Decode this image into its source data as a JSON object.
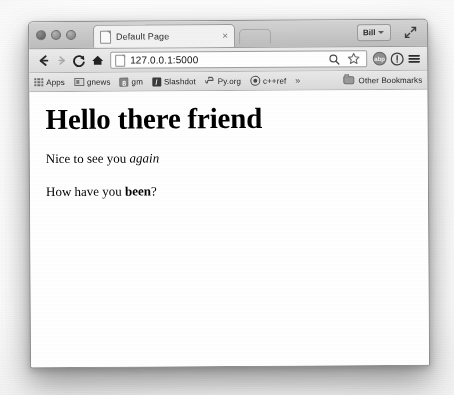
{
  "window": {
    "traffic_lights": [
      "close",
      "minimize",
      "zoom"
    ],
    "profile_name": "Bill",
    "fullscreen_icon": "fullscreen-arrows-icon"
  },
  "tabs": [
    {
      "title": "Default Page",
      "favicon": "document-icon",
      "close_label": "×",
      "active": true
    }
  ],
  "newtab": {
    "label": ""
  },
  "toolbar": {
    "back_icon": "back-arrow-icon",
    "forward_icon": "forward-arrow-icon",
    "reload_icon": "reload-icon",
    "home_icon": "home-icon",
    "url": "127.0.0.1:5000",
    "url_placeholder": "Search Google or type URL",
    "page_icon": "document-icon",
    "zoom_icon": "magnifier-icon",
    "bookmark_icon": "star-icon",
    "extension_icon": "abp-extension-icon",
    "extension_label": "abp",
    "info_icon": "info-circle-icon",
    "menu_icon": "hamburger-menu-icon"
  },
  "bookmarks": {
    "items": [
      {
        "label": "Apps",
        "icon": "apps-grid-icon"
      },
      {
        "label": "gnews",
        "icon": "gnews-icon"
      },
      {
        "label": "gm",
        "icon": "gm-icon"
      },
      {
        "label": "Slashdot",
        "icon": "slashdot-icon"
      },
      {
        "label": "Py.org",
        "icon": "python-icon"
      },
      {
        "label": "c++ref",
        "icon": "cppref-icon"
      }
    ],
    "overflow_label": "»",
    "other_bookmarks": {
      "label": "Other Bookmarks",
      "icon": "folder-icon"
    }
  },
  "page": {
    "heading": "Hello there friend",
    "paragraph1": {
      "before": "Nice to see you ",
      "emphasis": "again",
      "after": ""
    },
    "paragraph2": {
      "before": "How have you ",
      "strong": "been",
      "after": "?"
    }
  },
  "colors": {
    "page_background": "#ffffff",
    "chrome_toolbar": "#e4e4e4",
    "tabstrip": "#c6c6c6",
    "text": "#000000",
    "border": "#9a9a9a"
  }
}
